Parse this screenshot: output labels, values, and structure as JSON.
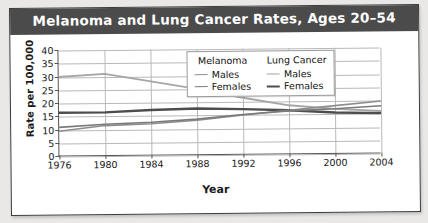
{
  "figure": {
    "title": "Melanoma and Lung Cancer Rates, Ages 20–54",
    "banner_color": "#4b4b4b",
    "title_color": "#ffffff"
  },
  "legend": {
    "groups": [
      {
        "heading": "Melanoma",
        "entries": [
          {
            "label": "Males",
            "color": "#8d8d8d",
            "width": 1.6
          },
          {
            "label": "Females",
            "color": "#7a7a7a",
            "width": 1.6
          }
        ]
      },
      {
        "heading": "Lung Cancer",
        "entries": [
          {
            "label": "Males",
            "color": "#a6a6a6",
            "width": 1.8
          },
          {
            "label": "Females",
            "color": "#4d4d4d",
            "width": 2.4
          }
        ]
      }
    ]
  },
  "chart_data": {
    "type": "line",
    "title": "Melanoma and Lung Cancer Rates, Ages 20–54",
    "xlabel": "Year",
    "ylabel": "Rate per 100,000",
    "xlim": [
      1976,
      2004
    ],
    "ylim": [
      0,
      40
    ],
    "yticks": [
      0,
      5,
      10,
      15,
      20,
      25,
      30,
      35,
      40
    ],
    "xticks": [
      1976,
      1980,
      1984,
      1988,
      1992,
      1996,
      2000,
      2004
    ],
    "grid": true,
    "legend_position": "top-center-inside",
    "x": [
      1976,
      1980,
      1984,
      1988,
      1992,
      1996,
      2000,
      2004
    ],
    "series": [
      {
        "name": "Lung Cancer Males",
        "color": "#a6a6a6",
        "width": 1.8,
        "values": [
          30.0,
          31.0,
          28.0,
          25.0,
          21.5,
          18.5,
          17.0,
          16.0
        ]
      },
      {
        "name": "Lung Cancer Females",
        "color": "#4d4d4d",
        "width": 2.4,
        "values": [
          16.5,
          16.5,
          17.2,
          17.6,
          17.2,
          16.6,
          15.6,
          15.2
        ]
      },
      {
        "name": "Melanoma Males",
        "color": "#8d8d8d",
        "width": 1.6,
        "values": [
          9.5,
          11.5,
          12.0,
          13.2,
          15.0,
          16.6,
          18.2,
          19.8
        ]
      },
      {
        "name": "Melanoma Females",
        "color": "#7a7a7a",
        "width": 1.6,
        "values": [
          11.0,
          12.0,
          12.6,
          13.6,
          15.2,
          16.4,
          17.0,
          18.0
        ]
      }
    ]
  }
}
